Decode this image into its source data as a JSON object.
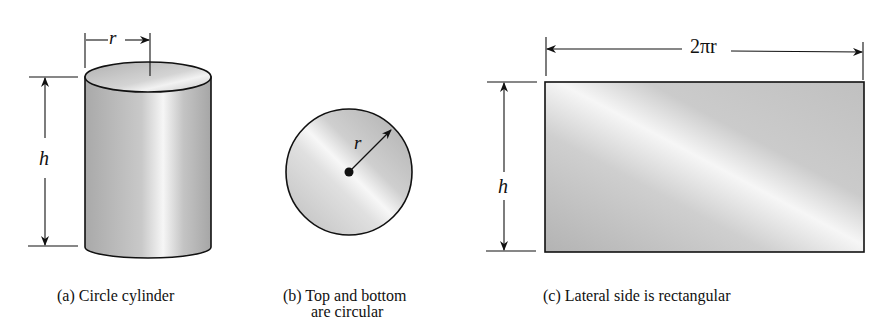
{
  "figure": {
    "panels": [
      {
        "id": "a",
        "shape": "cylinder",
        "caption": "(a) Circle cylinder",
        "labels": {
          "radius": "r",
          "height": "h"
        }
      },
      {
        "id": "b",
        "shape": "circle",
        "caption_line1": "(b) Top and bottom",
        "caption_line2": "are circular",
        "labels": {
          "radius": "r"
        }
      },
      {
        "id": "c",
        "shape": "rectangle",
        "caption": "(c) Lateral side is rectangular",
        "labels": {
          "width": "2πr",
          "height": "h"
        }
      }
    ],
    "colors": {
      "stroke": "#111111",
      "shade_dark": "#a8a8a8",
      "shade_light": "#f4f4f4"
    }
  }
}
